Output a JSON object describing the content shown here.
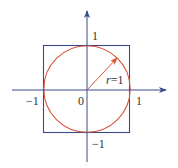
{
  "diagram": {
    "type": "unit-circle-inscribed-in-square",
    "colors": {
      "axis": "#3a4a8a",
      "square": "#3a4a8a",
      "circle": "#d9533a",
      "radius_arrow": "#d9533a",
      "text": "#333333"
    },
    "labels": {
      "y_pos": "1",
      "y_neg": "−1",
      "x_pos": "1",
      "x_neg": "−1",
      "origin": "0",
      "radius_var": "r",
      "radius_eq": "=1"
    }
  }
}
